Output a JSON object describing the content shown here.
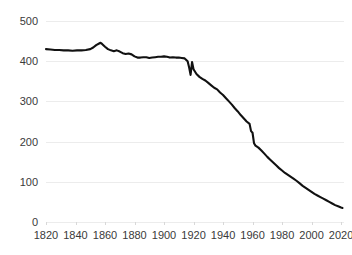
{
  "chart_data": {
    "type": "line",
    "title": "",
    "subtitle": "",
    "xlabel": "",
    "ylabel": "",
    "xlim": [
      1820,
      2022
    ],
    "ylim": [
      0,
      500
    ],
    "grid": true,
    "legend": false,
    "legend_position": "none",
    "line_color": "#111111",
    "grid_color": "#ececec",
    "tick_label_color": "#3a3a3a",
    "background_color": "#ffffff",
    "x_ticks": [
      1820,
      1840,
      1860,
      1880,
      1900,
      1920,
      1940,
      1960,
      1980,
      2000,
      2020
    ],
    "x_tick_labels": [
      "1820",
      "1840",
      "1860",
      "1880",
      "1900",
      "1920",
      "1940",
      "1960",
      "1980",
      "2000",
      "2020"
    ],
    "y_ticks": [
      0,
      100,
      200,
      300,
      400,
      500
    ],
    "y_tick_labels": [
      "0",
      "100",
      "200",
      "300",
      "400",
      "500"
    ],
    "series": [
      {
        "name": "series-1",
        "color": "#111111",
        "x": [
          1820,
          1823,
          1826,
          1829,
          1832,
          1835,
          1838,
          1841,
          1844,
          1847,
          1850,
          1852,
          1854,
          1856,
          1857,
          1858,
          1860,
          1862,
          1864,
          1866,
          1868,
          1870,
          1872,
          1874,
          1876,
          1878,
          1880,
          1882,
          1884,
          1886,
          1888,
          1890,
          1892,
          1894,
          1896,
          1898,
          1900,
          1902,
          1904,
          1906,
          1908,
          1910,
          1912,
          1914,
          1916,
          1917,
          1918,
          1919,
          1920,
          1922,
          1924,
          1926,
          1928,
          1930,
          1932,
          1934,
          1936,
          1938,
          1940,
          1942,
          1944,
          1946,
          1948,
          1950,
          1952,
          1954,
          1956,
          1958,
          1959,
          1960,
          1961,
          1962,
          1964,
          1966,
          1968,
          1970,
          1972,
          1974,
          1976,
          1978,
          1980,
          1982,
          1984,
          1986,
          1988,
          1990,
          1992,
          1994,
          1996,
          1998,
          2000,
          2002,
          2004,
          2006,
          2008,
          2010,
          2012,
          2014,
          2016,
          2018,
          2020,
          2021
        ],
        "y": [
          430,
          429,
          428,
          428,
          427,
          427,
          426,
          427,
          427,
          428,
          430,
          434,
          440,
          444,
          446,
          443,
          436,
          430,
          427,
          425,
          427,
          424,
          420,
          418,
          419,
          417,
          412,
          409,
          409,
          410,
          410,
          408,
          409,
          410,
          411,
          411,
          412,
          411,
          409,
          410,
          409,
          409,
          408,
          407,
          400,
          385,
          366,
          398,
          380,
          368,
          361,
          356,
          352,
          346,
          340,
          334,
          330,
          322,
          316,
          308,
          300,
          292,
          283,
          275,
          266,
          258,
          250,
          244,
          226,
          222,
          196,
          190,
          185,
          178,
          170,
          162,
          155,
          148,
          141,
          134,
          128,
          122,
          117,
          112,
          107,
          102,
          96,
          90,
          85,
          80,
          75,
          70,
          66,
          62,
          58,
          54,
          50,
          46,
          42,
          39,
          36,
          35
        ]
      }
    ]
  }
}
